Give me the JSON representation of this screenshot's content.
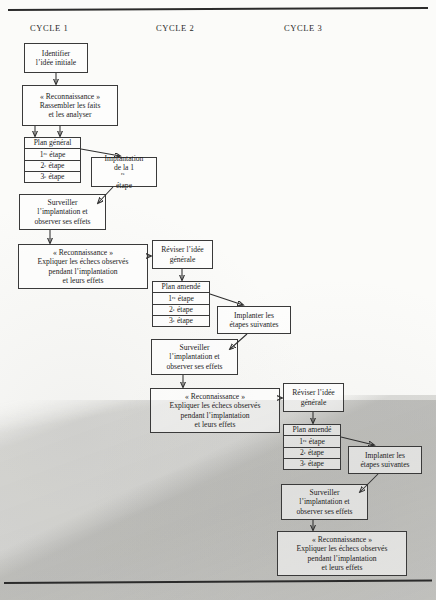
{
  "figure": {
    "cycle_labels": [
      {
        "id": "cycle-1",
        "text": "CYCLE 1"
      },
      {
        "id": "cycle-2",
        "text": "CYCLE 2"
      },
      {
        "id": "cycle-3",
        "text": "CYCLE 3"
      }
    ]
  },
  "cycle1": {
    "identifier": {
      "line1": "Identifier",
      "line2": "l’idée initiale"
    },
    "reconnaissance": {
      "line1": "« Reconnaissance »",
      "line2": "Rassembler les faits",
      "line3": "et les analyser"
    },
    "plan": {
      "header": "Plan général",
      "step1_num": "1",
      "step1_sup": "re",
      "step1_word": "étape",
      "step2_num": "2",
      "step2_sup": "e",
      "step2_word": "étape",
      "step3_num": "3",
      "step3_sup": "e",
      "step3_word": "étape"
    },
    "implantation": {
      "line1": "Implantation",
      "line2a": "de la 1",
      "line2sup": "re",
      "line2b": "étape"
    },
    "surveiller": {
      "line1": "Surveiller",
      "line2": "l’implantation et",
      "line3": "observer ses effets"
    },
    "reconnaissance2": {
      "line1": "« Reconnaissance »",
      "line2": "Expliquer les échecs observés",
      "line3": "pendant l’implantation",
      "line4": "et leurs effets"
    }
  },
  "cycle2": {
    "reviser": {
      "line1": "Réviser l’idée",
      "line2": "générale"
    },
    "plan": {
      "header": "Plan amendé",
      "step1_num": "1",
      "step1_sup": "re",
      "step1_word": "étape",
      "step2_num": "2",
      "step2_sup": "e",
      "step2_word": "étape",
      "step3_num": "3",
      "step3_sup": "e",
      "step3_word": "étape"
    },
    "implanter": {
      "line1": "Implanter les",
      "line2": "étapes suivantes"
    },
    "surveiller": {
      "line1": "Surveiller",
      "line2": "l’implantation et",
      "line3": "observer ses effets"
    },
    "reconnaissance": {
      "line1": "« Reconnaissance »",
      "line2": "Expliquer les échecs observés",
      "line3": "pendant l’implantation",
      "line4": "et leurs effets"
    }
  },
  "cycle3": {
    "reviser": {
      "line1": "Réviser l’idée",
      "line2": "générale"
    },
    "plan": {
      "header": "Plan amendé",
      "step1_num": "1",
      "step1_sup": "re",
      "step1_word": "étape",
      "step2_num": "2",
      "step2_sup": "e",
      "step2_word": "étape",
      "step3_num": "3",
      "step3_sup": "e",
      "step3_word": "étape"
    },
    "implanter": {
      "line1": "Implanter les",
      "line2": "étapes suivantes"
    },
    "surveiller": {
      "line1": "Surveiller",
      "line2": "l’implantation et",
      "line3": "observer ses effets"
    },
    "reconnaissance": {
      "line1": "« Reconnaissance »",
      "line2": "Expliquer les échecs observés",
      "line3": "pendant l’implantation",
      "line4": "et leurs effets"
    }
  },
  "colors": {
    "ink": "#1c1c1c",
    "stroke": "#3a3a3a",
    "paper": "#fbfbf9",
    "shadow": "#78786f"
  }
}
